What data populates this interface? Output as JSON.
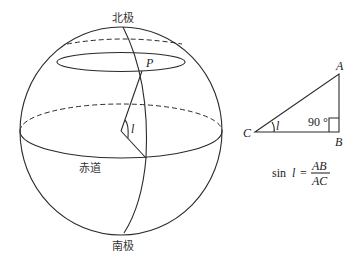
{
  "sphere": {
    "north_pole_label": "北极",
    "south_pole_label": "南极",
    "equator_label": "赤道",
    "point_label": "P",
    "angle_label": "l"
  },
  "triangle": {
    "vertex_a": "A",
    "vertex_b": "B",
    "vertex_c": "C",
    "angle_label": "l",
    "right_angle_label": "90 °"
  },
  "formula": {
    "lhs": "sin",
    "variable": "l",
    "equals": "=",
    "numerator": "AB",
    "denominator": "AC"
  },
  "colors": {
    "line": "#2a2a2a",
    "text": "#333333",
    "background": "#ffffff"
  }
}
